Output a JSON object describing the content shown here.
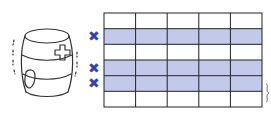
{
  "illustration": {
    "subject": "barrel with bandage and cross patch",
    "icon": "barrel-icon"
  },
  "grid": {
    "rows": 6,
    "columns": 5,
    "shaded_rows": [
      2,
      4,
      5
    ],
    "shade_color": "#c3c9ea",
    "line_color": "#222222",
    "marks": [
      {
        "row": 2,
        "symbol": "✖"
      },
      {
        "row": 4,
        "symbol": "✖"
      },
      {
        "row": 5,
        "symbol": "✖"
      }
    ],
    "mark_color": "#3b3fa8",
    "brace_symbol": "}"
  }
}
